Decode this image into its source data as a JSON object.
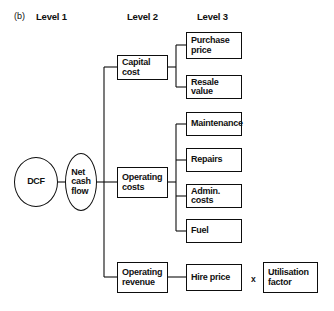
{
  "figure": {
    "marker": "(b)",
    "column_headers": [
      {
        "label": "Level 1"
      },
      {
        "label": "Level 2"
      },
      {
        "label": "Level 3"
      }
    ]
  },
  "level1": {
    "root": {
      "label": "DCF"
    },
    "aggregate": {
      "label": "Net\ncash\nflow"
    }
  },
  "level2": [
    {
      "label": "Capital cost"
    },
    {
      "label": "Operating\ncosts"
    },
    {
      "label": "Operating\nrevenue"
    }
  ],
  "level3": {
    "capital_cost": [
      {
        "label": "Purchase\nprice"
      },
      {
        "label": "Resale value"
      }
    ],
    "operating_costs": [
      {
        "label": "Maintenance"
      },
      {
        "label": "Repairs"
      },
      {
        "label": "Admin. costs"
      },
      {
        "label": "Fuel"
      }
    ],
    "operating_revenue": [
      {
        "label": "Hire price"
      }
    ]
  },
  "level4": {
    "operator": "x",
    "factor": {
      "label": "Utilisation\nfactor"
    }
  },
  "colors": {
    "stroke": "#0d0d0d",
    "text": "#101010",
    "background": "#ffffff"
  }
}
